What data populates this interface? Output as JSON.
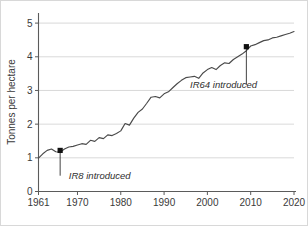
{
  "chart_data": {
    "type": "line",
    "title": "",
    "xlabel": "",
    "ylabel": "Tonnes per hectare",
    "xlim": [
      1961,
      2020
    ],
    "ylim": [
      0,
      5.3
    ],
    "grid": true,
    "legend": "none",
    "xticks": [
      1961,
      1970,
      1980,
      1990,
      2000,
      2010,
      2020
    ],
    "xtick_labels": [
      "1961",
      "1970",
      "1980",
      "1990",
      "2000",
      "2010",
      "2020"
    ],
    "yticks": [
      0,
      1,
      2,
      3,
      4,
      5
    ],
    "ytick_labels": [
      "0",
      "1",
      "2",
      "3",
      "4",
      "5"
    ],
    "series": [
      {
        "name": "Rice yield",
        "x": [
          1961,
          1962,
          1963,
          1964,
          1965,
          1966,
          1967,
          1968,
          1969,
          1970,
          1971,
          1972,
          1973,
          1974,
          1975,
          1976,
          1977,
          1978,
          1979,
          1980,
          1981,
          1982,
          1983,
          1984,
          1985,
          1986,
          1987,
          1988,
          1989,
          1990,
          1991,
          1992,
          1993,
          1994,
          1995,
          1996,
          1997,
          1998,
          1999,
          2000,
          2001,
          2002,
          2003,
          2004,
          2005,
          2006,
          2007,
          2008,
          2009,
          2010,
          2011,
          2012,
          2013,
          2014,
          2015,
          2016,
          2017,
          2018,
          2019,
          2020
        ],
        "values": [
          0.99,
          1.12,
          1.22,
          1.26,
          1.18,
          1.17,
          1.26,
          1.32,
          1.34,
          1.38,
          1.42,
          1.4,
          1.52,
          1.49,
          1.6,
          1.57,
          1.68,
          1.66,
          1.72,
          1.8,
          2.02,
          1.97,
          2.18,
          2.35,
          2.45,
          2.62,
          2.8,
          2.82,
          2.78,
          2.9,
          2.96,
          3.08,
          3.2,
          3.3,
          3.38,
          3.4,
          3.42,
          3.36,
          3.52,
          3.62,
          3.68,
          3.62,
          3.74,
          3.82,
          3.8,
          3.92,
          4.0,
          4.08,
          4.18,
          4.32,
          4.36,
          4.42,
          4.48,
          4.5,
          4.56,
          4.58,
          4.62,
          4.66,
          4.7,
          4.75
        ]
      }
    ],
    "annotations": [
      {
        "id": "ir8",
        "label": "IR8 introduced",
        "x": 1966,
        "y": 1.22,
        "label_x": 1968,
        "label_y": 0.38,
        "marker": "square"
      },
      {
        "id": "ir64",
        "label": "IR64 introduced",
        "x": 2009,
        "y": 4.3,
        "label_x": 1996,
        "label_y": 3.08,
        "marker": "square"
      }
    ],
    "colors": {
      "line": "#4a4a4a",
      "grid": "#c9c9c9",
      "axis": "#5b5b5b",
      "marker": "#111111",
      "text": "#3a3a3a",
      "background": "#ffffff",
      "border": "#d8d8d8"
    }
  }
}
